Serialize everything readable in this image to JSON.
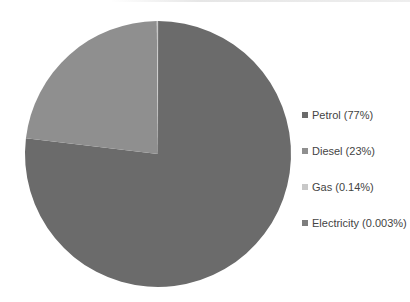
{
  "chart_data": {
    "type": "pie",
    "title": "",
    "categories": [
      "Petrol",
      "Diesel",
      "Gas",
      "Electricity"
    ],
    "values": [
      77,
      23,
      0.14,
      0.003
    ],
    "unit": "%",
    "colors": [
      "#6b6b6b",
      "#8f8f8f",
      "#c8c8c8",
      "#7d7d7d"
    ],
    "start_angle_deg": 0,
    "direction": "clockwise",
    "legend_position": "right",
    "legend": [
      {
        "label": "Petrol (77%)",
        "color": "#6b6b6b"
      },
      {
        "label": "Diesel (23%)",
        "color": "#8f8f8f"
      },
      {
        "label": "Gas (0.14%)",
        "color": "#c8c8c8"
      },
      {
        "label": "Electricity (0.003%)",
        "color": "#7d7d7d"
      }
    ]
  }
}
